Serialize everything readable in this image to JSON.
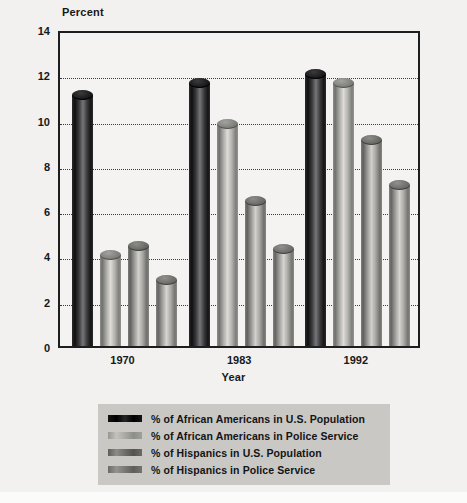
{
  "chart_data": {
    "type": "bar",
    "title": "",
    "xlabel": "Year",
    "ylabel": "Percent",
    "categories": [
      "1970",
      "1983",
      "1992"
    ],
    "ylim": [
      0,
      14
    ],
    "yticks": [
      0,
      2,
      4,
      6,
      8,
      10,
      12,
      14
    ],
    "ytick_labels": [
      "0",
      "2",
      "4",
      "6",
      "8",
      "10",
      "12",
      "14"
    ],
    "grid": true,
    "grid_style": "dotted-horizontal",
    "legend_position": "bottom",
    "bar_style": "3d-cylinder",
    "series": [
      {
        "name": "% of African Americans in U.S. Population",
        "color": "#111112",
        "values": [
          11.1,
          11.6,
          12.0
        ]
      },
      {
        "name": "% of African Americans in Police Service",
        "color": "#b9b8b4",
        "values": [
          4.0,
          9.8,
          11.6
        ]
      },
      {
        "name": "% of Hispanics in U.S. Population",
        "color": "#8a8a86",
        "values": [
          4.4,
          6.4,
          9.1
        ]
      },
      {
        "name": "% of Hispanics in Police Service",
        "color": "#8f8f8b",
        "values": [
          2.9,
          4.3,
          7.1
        ]
      }
    ]
  },
  "axes": {
    "y_title": "Percent",
    "x_title": "Year"
  },
  "colors": {
    "background": "#f2f1ef",
    "plot_background": "#f4f3f1",
    "frame": "#1d1e20",
    "grid": "#3a3b3d",
    "legend_background": "#c9c8c5",
    "text": "#17181a"
  }
}
